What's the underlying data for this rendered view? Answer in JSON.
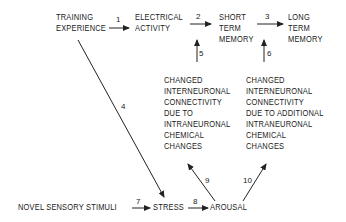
{
  "nodes": {
    "training_experience": [
      "TRAINING",
      "EXPERIENCE"
    ],
    "electrical_activity": [
      "ELECTRICAL",
      "ACTIVITY"
    ],
    "short_term_memory": [
      "SHORT",
      "TERM",
      "MEMORY"
    ],
    "long_term_memory": [
      "LONG",
      "TERM",
      "MEMORY"
    ],
    "changed_connectivity_1": [
      "CHANGED",
      "INTERNEURONAL",
      "CONNECTIVITY",
      "DUE TO",
      "INTRANEURONAL",
      "CHEMICAL",
      "CHANGES"
    ],
    "changed_connectivity_2": [
      "CHANGED",
      "INTERNEURONAL",
      "CONNECTIVITY",
      "DUE TO ADDITIONAL",
      "INTRANEURONAL",
      "CHEMICAL",
      "CHANGES"
    ],
    "novel_sensory_stimuli": [
      "NOVEL SENSORY STIMULI"
    ],
    "stress": [
      "STRESS"
    ],
    "arousal": [
      "AROUSAL"
    ]
  },
  "edges": [
    {
      "label": "1",
      "from": "TRAINING EXPERIENCE",
      "to": "ELECTRICAL ACTIVITY"
    },
    {
      "label": "2",
      "from": "ELECTRICAL ACTIVITY",
      "to": "SHORT TERM MEMORY"
    },
    {
      "label": "3",
      "from": "SHORT TERM MEMORY",
      "to": "LONG TERM MEMORY"
    },
    {
      "label": "4",
      "from": "TRAINING EXPERIENCE",
      "to": "STRESS"
    },
    {
      "label": "5",
      "from": "CHANGED CONNECTIVITY (INTRANEURONAL)",
      "to": "SHORT TERM MEMORY"
    },
    {
      "label": "6",
      "from": "CHANGED CONNECTIVITY (ADDITIONAL)",
      "to": "LONG TERM MEMORY"
    },
    {
      "label": "7",
      "from": "NOVEL SENSORY STIMULI",
      "to": "STRESS"
    },
    {
      "label": "8",
      "from": "STRESS",
      "to": "AROUSAL"
    },
    {
      "label": "9",
      "from": "AROUSAL",
      "to": "CHANGED CONNECTIVITY (INTRANEURONAL)"
    },
    {
      "label": "10",
      "from": "AROUSAL",
      "to": "CHANGED CONNECTIVITY (ADDITIONAL)"
    }
  ]
}
